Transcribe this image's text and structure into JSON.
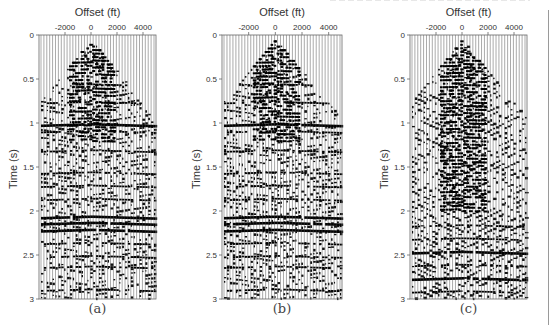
{
  "figure": {
    "panels": [
      {
        "id": "a",
        "caption": "(a)",
        "frame": {
          "left": 39,
          "top": 35,
          "right": 156,
          "bottom": 299
        }
      },
      {
        "id": "b",
        "caption": "(b)",
        "frame": {
          "left": 222,
          "top": 35,
          "right": 342,
          "bottom": 299
        }
      },
      {
        "id": "c",
        "caption": "(c)",
        "frame": {
          "left": 410,
          "top": 35,
          "right": 527,
          "bottom": 299
        }
      }
    ],
    "xlabel": "Offset (ft)",
    "ylabel": "Time (s)",
    "xticks": [
      "-2000",
      "0",
      "2000",
      "4000"
    ],
    "yticks": [
      "0",
      "0.5",
      "1",
      "1.5",
      "2",
      "2.5",
      "3"
    ]
  },
  "chart_data": [
    {
      "type": "heatmap",
      "title": "(a)",
      "subtype": "seismic wiggle gather",
      "xlabel": "Offset (ft)",
      "ylabel": "Time (s)",
      "xticks": [
        -2000,
        0,
        2000,
        4000
      ],
      "yticks": [
        0,
        0.5,
        1,
        1.5,
        2,
        2.5,
        3
      ],
      "xlim": [
        -4000,
        5000
      ],
      "ylim": [
        3,
        0
      ],
      "reflector_times_s": [
        0.55,
        0.75,
        1.0,
        1.08,
        1.3,
        1.55,
        1.7,
        1.85,
        2.05,
        2.12,
        2.2,
        2.35,
        2.5,
        2.62,
        2.88
      ],
      "strong_reflectors_s": [
        1.0,
        2.08,
        2.15
      ],
      "mute_apex_offset_ft": 0,
      "noise_level": "low"
    },
    {
      "type": "heatmap",
      "title": "(b)",
      "subtype": "seismic wiggle gather",
      "xlabel": "Offset (ft)",
      "ylabel": "Time (s)",
      "xticks": [
        -2000,
        0,
        2000,
        4000
      ],
      "yticks": [
        0,
        0.5,
        1,
        1.5,
        2,
        2.5,
        3
      ],
      "xlim": [
        -4000,
        5000
      ],
      "ylim": [
        3,
        0
      ],
      "reflector_times_s": [
        0.55,
        0.75,
        1.0,
        1.08,
        1.3,
        1.55,
        1.7,
        1.85,
        2.05,
        2.12,
        2.2,
        2.35,
        2.5,
        2.62,
        2.88
      ],
      "strong_reflectors_s": [
        1.0,
        2.08,
        2.15
      ],
      "mute_apex_offset_ft": 0,
      "noise_level": "low"
    },
    {
      "type": "heatmap",
      "title": "(c)",
      "subtype": "seismic wiggle gather",
      "xlabel": "Offset (ft)",
      "ylabel": "Time (s)",
      "xticks": [
        -2000,
        0,
        2000,
        4000
      ],
      "yticks": [
        0,
        0.5,
        1,
        1.5,
        2,
        2.5,
        3
      ],
      "xlim": [
        -4000,
        5000
      ],
      "ylim": [
        3,
        0
      ],
      "reflector_times_s": [
        2.15,
        2.3,
        2.45,
        2.6,
        2.75,
        2.9
      ],
      "strong_reflectors_s": [
        2.45,
        2.75
      ],
      "mute_apex_offset_ft": 0,
      "noise_level": "high (ground-roll dominated)"
    }
  ]
}
